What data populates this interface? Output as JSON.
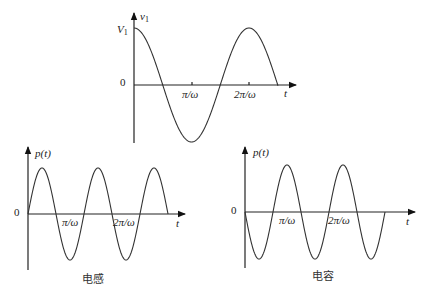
{
  "figure": {
    "panels": [
      {
        "id": "voltage",
        "y_label": "v1",
        "y_label_sub": "1",
        "amplitude_label": "V1",
        "origin_label": "0",
        "x_label": "t",
        "ticks": [
          "π/ω",
          "2π/ω"
        ],
        "waveform": "cosine",
        "caption": ""
      },
      {
        "id": "inductor",
        "y_label": "p(t)",
        "origin_label": "0",
        "x_label": "t",
        "ticks": [
          "π/ω",
          "2π/ω"
        ],
        "waveform": "sine, double frequency",
        "caption": "电感"
      },
      {
        "id": "capacitor",
        "y_label": "p(t)",
        "origin_label": "0",
        "x_label": "t",
        "ticks": [
          "π/ω",
          "2π/ω"
        ],
        "waveform": "negative sine, double frequency",
        "caption": "电容"
      }
    ]
  },
  "chart_data": [
    {
      "type": "line",
      "title": "",
      "xlabel": "t",
      "ylabel": "v1",
      "x_ticks": [
        "0",
        "π/ω",
        "2π/ω"
      ],
      "y_ticks": [
        "0",
        "V1"
      ],
      "series": [
        {
          "name": "v1(t) = V1 cos(ωt)",
          "x": [
            0,
            0.5,
            1,
            1.5,
            2,
            2.5
          ],
          "y": [
            1,
            0,
            -1,
            0,
            1,
            0
          ],
          "x_unit": "π/ω"
        }
      ]
    },
    {
      "type": "line",
      "title": "电感",
      "xlabel": "t",
      "ylabel": "p(t)",
      "x_ticks": [
        "0",
        "π/ω",
        "2π/ω"
      ],
      "series": [
        {
          "name": "p(t) inductor",
          "x": [
            0,
            0.25,
            0.5,
            0.75,
            1,
            1.25,
            1.5,
            1.75,
            2,
            2.25,
            2.5
          ],
          "y": [
            0,
            1,
            0,
            -1,
            0,
            1,
            0,
            -1,
            0,
            1,
            0
          ],
          "x_unit": "π/ω"
        }
      ]
    },
    {
      "type": "line",
      "title": "电容",
      "xlabel": "t",
      "ylabel": "p(t)",
      "x_ticks": [
        "0",
        "π/ω",
        "2π/ω"
      ],
      "series": [
        {
          "name": "p(t) capacitor",
          "x": [
            0,
            0.25,
            0.5,
            0.75,
            1,
            1.25,
            1.5,
            1.75,
            2,
            2.25,
            2.5
          ],
          "y": [
            0,
            -1,
            0,
            1,
            0,
            -1,
            0,
            1,
            0,
            -1,
            0
          ],
          "x_unit": "π/ω"
        }
      ]
    }
  ]
}
